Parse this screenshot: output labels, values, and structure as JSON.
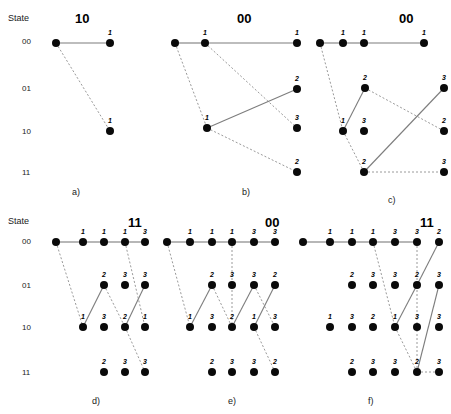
{
  "figure": {
    "axis_caption_top": "State",
    "axis_caption_bottom": "State",
    "state_labels": [
      "00",
      "01",
      "10",
      "11"
    ],
    "row_y": {
      "s00": 43,
      "s01": 88,
      "s10": 131,
      "s11": 172
    },
    "row_y_bottom": {
      "s00": 242,
      "s01": 285,
      "s10": 327,
      "s11": 372
    },
    "node_radius": 4.0
  },
  "chart_data": {
    "type": "scatter",
    "title": "",
    "xlabel": "",
    "ylabel": "State",
    "ytick_labels": [
      "00",
      "01",
      "10",
      "11"
    ],
    "grid": false,
    "legend": "none",
    "panels": [
      {
        "id": "a",
        "caption": "a)",
        "caption_x": 72,
        "caption_y": 187,
        "title": "10",
        "title_x": 75,
        "title_y": 11,
        "nodes": [
          {
            "x": 56,
            "y": 43,
            "state": "00",
            "label": ""
          },
          {
            "x": 110,
            "y": 43,
            "state": "00",
            "label": "1"
          },
          {
            "x": 110,
            "y": 131,
            "state": "10",
            "label": "1"
          }
        ],
        "edges": [
          {
            "from": 0,
            "to": 1,
            "style": "solid"
          },
          {
            "from": 0,
            "to": 2,
            "style": "dashed"
          }
        ]
      },
      {
        "id": "b",
        "caption": "b)",
        "caption_x": 242,
        "caption_y": 187,
        "title": "00",
        "title_x": 237,
        "title_y": 11,
        "nodes": [
          {
            "x": 175,
            "y": 43,
            "state": "00",
            "label": ""
          },
          {
            "x": 205,
            "y": 43,
            "state": "00",
            "label": "1"
          },
          {
            "x": 297,
            "y": 43,
            "state": "00",
            "label": "1"
          },
          {
            "x": 297,
            "y": 89,
            "state": "01",
            "label": "2"
          },
          {
            "x": 207,
            "y": 128,
            "state": "10",
            "label": "1"
          },
          {
            "x": 297,
            "y": 128,
            "state": "10",
            "label": "3"
          },
          {
            "x": 297,
            "y": 172,
            "state": "11",
            "label": "2"
          }
        ],
        "edges": [
          {
            "from": 0,
            "to": 1,
            "style": "solid"
          },
          {
            "from": 1,
            "to": 2,
            "style": "solid"
          },
          {
            "from": 0,
            "to": 4,
            "style": "dashed"
          },
          {
            "from": 1,
            "to": 5,
            "style": "dashed"
          },
          {
            "from": 4,
            "to": 3,
            "style": "solid"
          },
          {
            "from": 4,
            "to": 6,
            "style": "dashed"
          }
        ]
      },
      {
        "id": "c",
        "caption": "c)",
        "caption_x": 388,
        "caption_y": 195,
        "title": "00",
        "title_x": 399,
        "title_y": 11,
        "nodes": [
          {
            "x": 320,
            "y": 43,
            "state": "00",
            "label": ""
          },
          {
            "x": 343,
            "y": 43,
            "state": "00",
            "label": "1"
          },
          {
            "x": 364,
            "y": 43,
            "state": "00",
            "label": "1"
          },
          {
            "x": 424,
            "y": 43,
            "state": "00",
            "label": "1"
          },
          {
            "x": 365,
            "y": 88,
            "state": "01",
            "label": "2"
          },
          {
            "x": 444,
            "y": 88,
            "state": "01",
            "label": "3"
          },
          {
            "x": 343,
            "y": 131,
            "state": "10",
            "label": "1"
          },
          {
            "x": 364,
            "y": 131,
            "state": "10",
            "label": "3"
          },
          {
            "x": 444,
            "y": 131,
            "state": "10",
            "label": "2"
          },
          {
            "x": 364,
            "y": 172,
            "state": "11",
            "label": "2"
          },
          {
            "x": 444,
            "y": 172,
            "state": "11",
            "label": "3"
          }
        ],
        "edges": [
          {
            "from": 0,
            "to": 1,
            "style": "solid"
          },
          {
            "from": 1,
            "to": 2,
            "style": "solid"
          },
          {
            "from": 2,
            "to": 3,
            "style": "solid"
          },
          {
            "from": 0,
            "to": 6,
            "style": "dashed"
          },
          {
            "from": 6,
            "to": 4,
            "style": "solid"
          },
          {
            "from": 4,
            "to": 8,
            "style": "dashed"
          },
          {
            "from": 6,
            "to": 9,
            "style": "dashed"
          },
          {
            "from": 9,
            "to": 5,
            "style": "solid"
          },
          {
            "from": 9,
            "to": 10,
            "style": "dashed"
          }
        ]
      },
      {
        "id": "d",
        "caption": "d)",
        "caption_x": 92,
        "caption_y": 396,
        "title": "11",
        "title_x": 128,
        "title_y": 215,
        "nodes": [
          {
            "x": 56,
            "y": 242,
            "state": "00",
            "label": ""
          },
          {
            "x": 83,
            "y": 242,
            "state": "00",
            "label": "1"
          },
          {
            "x": 104,
            "y": 242,
            "state": "00",
            "label": "1"
          },
          {
            "x": 125,
            "y": 242,
            "state": "00",
            "label": "1"
          },
          {
            "x": 145,
            "y": 242,
            "state": "00",
            "label": "3"
          },
          {
            "x": 104,
            "y": 285,
            "state": "01",
            "label": "2"
          },
          {
            "x": 125,
            "y": 285,
            "state": "01",
            "label": "3"
          },
          {
            "x": 145,
            "y": 285,
            "state": "01",
            "label": "3"
          },
          {
            "x": 83,
            "y": 327,
            "state": "10",
            "label": "1"
          },
          {
            "x": 104,
            "y": 327,
            "state": "10",
            "label": "3"
          },
          {
            "x": 125,
            "y": 327,
            "state": "10",
            "label": "2"
          },
          {
            "x": 145,
            "y": 327,
            "state": "10",
            "label": "1"
          },
          {
            "x": 104,
            "y": 372,
            "state": "11",
            "label": "2"
          },
          {
            "x": 125,
            "y": 372,
            "state": "11",
            "label": "3"
          },
          {
            "x": 145,
            "y": 372,
            "state": "11",
            "label": "3"
          }
        ],
        "edges": [
          {
            "from": 0,
            "to": 1,
            "style": "solid"
          },
          {
            "from": 1,
            "to": 2,
            "style": "solid"
          },
          {
            "from": 2,
            "to": 3,
            "style": "solid"
          },
          {
            "from": 3,
            "to": 4,
            "style": "solid"
          },
          {
            "from": 0,
            "to": 8,
            "style": "dashed"
          },
          {
            "from": 8,
            "to": 5,
            "style": "solid"
          },
          {
            "from": 5,
            "to": 10,
            "style": "dashed"
          },
          {
            "from": 10,
            "to": 7,
            "style": "solid"
          },
          {
            "from": 3,
            "to": 11,
            "style": "dashed"
          },
          {
            "from": 10,
            "to": 14,
            "style": "dashed"
          }
        ]
      },
      {
        "id": "e",
        "caption": "e)",
        "caption_x": 228,
        "caption_y": 396,
        "title": "00",
        "title_x": 265,
        "title_y": 215,
        "nodes": [
          {
            "x": 167,
            "y": 242,
            "state": "00",
            "label": ""
          },
          {
            "x": 190,
            "y": 242,
            "state": "00",
            "label": "1"
          },
          {
            "x": 212,
            "y": 242,
            "state": "00",
            "label": "1"
          },
          {
            "x": 232,
            "y": 242,
            "state": "00",
            "label": "1"
          },
          {
            "x": 254,
            "y": 242,
            "state": "00",
            "label": "3"
          },
          {
            "x": 275,
            "y": 242,
            "state": "00",
            "label": "3"
          },
          {
            "x": 212,
            "y": 285,
            "state": "01",
            "label": "2"
          },
          {
            "x": 232,
            "y": 285,
            "state": "01",
            "label": "3"
          },
          {
            "x": 254,
            "y": 285,
            "state": "01",
            "label": "3"
          },
          {
            "x": 275,
            "y": 285,
            "state": "01",
            "label": "2"
          },
          {
            "x": 190,
            "y": 327,
            "state": "10",
            "label": "1"
          },
          {
            "x": 212,
            "y": 327,
            "state": "10",
            "label": "3"
          },
          {
            "x": 232,
            "y": 327,
            "state": "10",
            "label": "2"
          },
          {
            "x": 254,
            "y": 327,
            "state": "10",
            "label": "1"
          },
          {
            "x": 275,
            "y": 327,
            "state": "10",
            "label": "3"
          },
          {
            "x": 212,
            "y": 372,
            "state": "11",
            "label": "2"
          },
          {
            "x": 232,
            "y": 372,
            "state": "11",
            "label": "3"
          },
          {
            "x": 254,
            "y": 372,
            "state": "11",
            "label": "3"
          },
          {
            "x": 275,
            "y": 372,
            "state": "11",
            "label": "2"
          }
        ],
        "edges": [
          {
            "from": 0,
            "to": 1,
            "style": "solid"
          },
          {
            "from": 1,
            "to": 2,
            "style": "solid"
          },
          {
            "from": 2,
            "to": 3,
            "style": "solid"
          },
          {
            "from": 3,
            "to": 4,
            "style": "solid"
          },
          {
            "from": 4,
            "to": 5,
            "style": "solid"
          },
          {
            "from": 0,
            "to": 10,
            "style": "dashed"
          },
          {
            "from": 10,
            "to": 6,
            "style": "solid"
          },
          {
            "from": 6,
            "to": 12,
            "style": "dashed"
          },
          {
            "from": 3,
            "to": 12,
            "style": "dashed"
          },
          {
            "from": 12,
            "to": 8,
            "style": "solid"
          },
          {
            "from": 8,
            "to": 14,
            "style": "dashed"
          },
          {
            "from": 13,
            "to": 9,
            "style": "solid"
          },
          {
            "from": 13,
            "to": 18,
            "style": "dashed"
          }
        ]
      },
      {
        "id": "f",
        "caption": "f)",
        "caption_x": 368,
        "caption_y": 396,
        "title": "11",
        "title_x": 420,
        "title_y": 215,
        "nodes": [
          {
            "x": 303,
            "y": 242,
            "state": "00",
            "label": ""
          },
          {
            "x": 330,
            "y": 242,
            "state": "00",
            "label": "1"
          },
          {
            "x": 352,
            "y": 242,
            "state": "00",
            "label": "1"
          },
          {
            "x": 373,
            "y": 242,
            "state": "00",
            "label": "1"
          },
          {
            "x": 395,
            "y": 242,
            "state": "00",
            "label": "3"
          },
          {
            "x": 417,
            "y": 242,
            "state": "00",
            "label": "3"
          },
          {
            "x": 439,
            "y": 242,
            "state": "00",
            "label": "2"
          },
          {
            "x": 352,
            "y": 285,
            "state": "01",
            "label": "2"
          },
          {
            "x": 373,
            "y": 285,
            "state": "01",
            "label": "3"
          },
          {
            "x": 395,
            "y": 285,
            "state": "01",
            "label": "3"
          },
          {
            "x": 417,
            "y": 285,
            "state": "01",
            "label": "2"
          },
          {
            "x": 439,
            "y": 285,
            "state": "01",
            "label": "3"
          },
          {
            "x": 330,
            "y": 327,
            "state": "10",
            "label": "1"
          },
          {
            "x": 352,
            "y": 327,
            "state": "10",
            "label": "3"
          },
          {
            "x": 373,
            "y": 327,
            "state": "10",
            "label": "2"
          },
          {
            "x": 395,
            "y": 327,
            "state": "10",
            "label": "1"
          },
          {
            "x": 417,
            "y": 327,
            "state": "10",
            "label": "3"
          },
          {
            "x": 439,
            "y": 327,
            "state": "10",
            "label": "3"
          },
          {
            "x": 352,
            "y": 372,
            "state": "11",
            "label": "2"
          },
          {
            "x": 373,
            "y": 372,
            "state": "11",
            "label": "3"
          },
          {
            "x": 395,
            "y": 372,
            "state": "11",
            "label": "3"
          },
          {
            "x": 417,
            "y": 372,
            "state": "11",
            "label": "2"
          },
          {
            "x": 439,
            "y": 372,
            "state": "11",
            "label": "3"
          }
        ],
        "edges": [
          {
            "from": 0,
            "to": 1,
            "style": "solid"
          },
          {
            "from": 1,
            "to": 2,
            "style": "solid"
          },
          {
            "from": 2,
            "to": 3,
            "style": "solid"
          },
          {
            "from": 3,
            "to": 4,
            "style": "solid"
          },
          {
            "from": 4,
            "to": 5,
            "style": "solid"
          },
          {
            "from": 3,
            "to": 15,
            "style": "dashed"
          },
          {
            "from": 15,
            "to": 10,
            "style": "solid"
          },
          {
            "from": 10,
            "to": 6,
            "style": "solid"
          },
          {
            "from": 5,
            "to": 21,
            "style": "dashed"
          },
          {
            "from": 15,
            "to": 21,
            "style": "dashed"
          },
          {
            "from": 21,
            "to": 11,
            "style": "solid"
          },
          {
            "from": 21,
            "to": 22,
            "style": "dashed"
          }
        ]
      }
    ]
  }
}
